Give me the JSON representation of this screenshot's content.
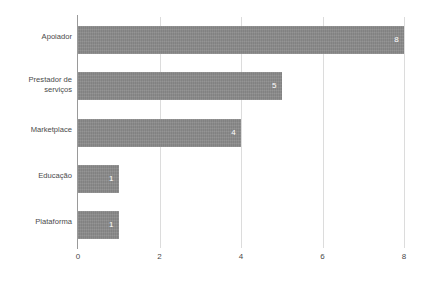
{
  "chart_data": {
    "type": "bar",
    "orientation": "horizontal",
    "title": "",
    "subtitle": "",
    "xlabel": "",
    "ylabel": "",
    "categories": [
      "Apoiador",
      "Prestador de serviços",
      "Marketplace",
      "Educação",
      "Plataforma"
    ],
    "values": [
      8,
      5,
      4,
      1,
      1
    ],
    "value_labels": [
      "8",
      "5",
      "4",
      "1",
      "1"
    ],
    "xlim": [
      0,
      8
    ],
    "xticks": [
      0,
      2,
      4,
      6,
      8
    ],
    "xtick_labels": [
      "0",
      "2",
      "4",
      "6",
      "8"
    ],
    "grid": "vertical",
    "legend": "none",
    "colors": {
      "bar": "#8a8a8a",
      "bar_label": "#ffffff",
      "axis_line": "#9a9a9a",
      "gridline": "#dcdcdc",
      "tick_text": "#4a4a4a",
      "category_text": "#4a4a4a",
      "background": "#ffffff"
    },
    "category_label_lines": [
      [
        "Apoiador"
      ],
      [
        "Prestador de",
        "serviços"
      ],
      [
        "Marketplace"
      ],
      [
        "Educação"
      ],
      [
        "Plataforma"
      ]
    ]
  }
}
